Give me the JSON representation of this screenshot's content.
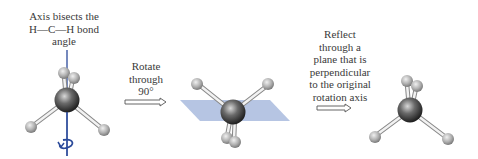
{
  "steps": [
    {
      "id": "initial",
      "caption_lines": [
        "Axis bisects the",
        "H—C—H bond",
        "angle"
      ]
    },
    {
      "id": "rotate",
      "caption_lines": [
        "Rotate",
        "through",
        "90°"
      ]
    },
    {
      "id": "reflect",
      "caption_lines": [
        "Reflect",
        "through a",
        "plane that is",
        "perpendicular",
        "to the original",
        "rotation axis"
      ]
    }
  ],
  "colors": {
    "axis": "#2b4a9a",
    "plane": "#aebfe0",
    "carbon": "#4a4a4a",
    "hydrogen": "#b8b8b8",
    "bond": "#e8e8e8",
    "arrow_outline": "#555555"
  },
  "icons": [
    "rotation-arrow-icon",
    "right-arrow-icon"
  ]
}
